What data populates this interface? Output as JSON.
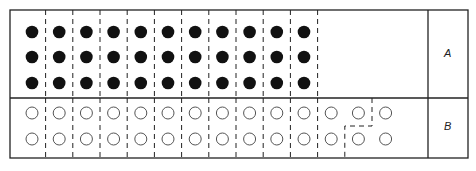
{
  "diagram": {
    "rows": [
      {
        "label": "A",
        "dot_style": "filled",
        "columns": 11,
        "dots_per_column": 3
      },
      {
        "label": "B",
        "dot_style": "open",
        "columns": 14,
        "dots_per_column": 2
      }
    ],
    "colors": {
      "line": "#222222",
      "filled_dot": "#111111",
      "open_dot": "#555555",
      "background": "#ffffff"
    },
    "caption": "Grouping of dots (caption text cut off at bottom of image)"
  }
}
